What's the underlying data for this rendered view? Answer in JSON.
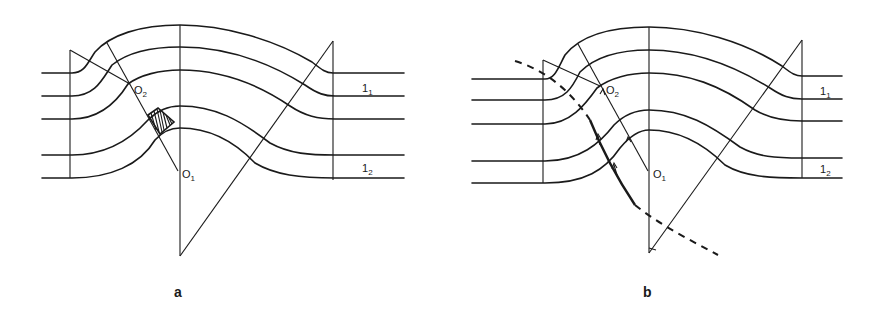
{
  "figure": {
    "panels": [
      {
        "id": "a",
        "caption": "a",
        "labels": {
          "O2": {
            "main": "O",
            "sub": "2"
          },
          "O1": {
            "main": "O",
            "sub": "1"
          },
          "l1": {
            "main": "1",
            "sub": "1"
          },
          "l2": {
            "main": "1",
            "sub": "2"
          }
        },
        "features": [
          "five flow lines bent over an arch",
          "hatched region near O2-O1 radial",
          "radial lines from O1 and O2"
        ]
      },
      {
        "id": "b",
        "caption": "b",
        "labels": {
          "O2": {
            "main": "O",
            "sub": "2"
          },
          "O1": {
            "main": "O",
            "sub": "1"
          },
          "l1": {
            "main": "1",
            "sub": "1"
          },
          "l2": {
            "main": "1",
            "sub": "2"
          }
        },
        "features": [
          "five flow lines bent over an arch",
          "dashed curve boundary",
          "arrows along radial directions"
        ]
      }
    ]
  }
}
